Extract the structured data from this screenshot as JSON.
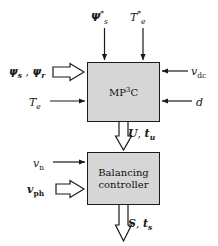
{
  "diagram": {
    "blocks": [
      {
        "id": "mp3c",
        "label_main": "MP",
        "label_sup": "3",
        "label_tail": "C"
      },
      {
        "id": "balancing",
        "line1": "Balancing",
        "line2": "controller"
      }
    ],
    "signals": {
      "psi_s_ref": {
        "base": "Ψ",
        "sup": "*",
        "sub": "s",
        "text": "Ψ*s",
        "direction": "into-mp3c-top",
        "arrow": "thin"
      },
      "te_ref": {
        "base": "T",
        "sup": "*",
        "sub": "e",
        "text": "T*e",
        "direction": "into-mp3c-top",
        "arrow": "thin"
      },
      "psi_sr": {
        "base": "ψ",
        "sub1": "s",
        "sub2": "r",
        "text": "ψs , ψr",
        "direction": "into-mp3c-left",
        "arrow": "hollow"
      },
      "te": {
        "base": "T",
        "sub": "e",
        "text": "Te",
        "direction": "into-mp3c-left",
        "arrow": "thin"
      },
      "vdc": {
        "base": "v",
        "sub": "dc",
        "text": "vdc",
        "direction": "into-mp3c-right",
        "arrow": "thin"
      },
      "d": {
        "base": "d",
        "sub": "",
        "text": "d",
        "direction": "into-mp3c-right",
        "arrow": "thin"
      },
      "u_tu": {
        "base": "U",
        "sub": "u",
        "text": "U, tu",
        "direction": "mp3c-to-balancing",
        "arrow": "hollow"
      },
      "vn": {
        "base": "v",
        "sub": "n",
        "text": "vn",
        "direction": "into-balancing-left",
        "arrow": "thin"
      },
      "vph": {
        "base": "v",
        "sub": "ph",
        "text": "vph",
        "direction": "into-balancing-left",
        "arrow": "hollow"
      },
      "s_ts": {
        "base": "S",
        "sub": "s",
        "text": "S, ts",
        "direction": "out-of-balancing-bottom",
        "arrow": "hollow"
      }
    },
    "colors": {
      "block_fill": "#d6d6d6",
      "block_border": "#1c1c1c",
      "line": "#1a1a1a",
      "background": "#ffffff",
      "hollow_arrow_fill": "#ffffff"
    }
  }
}
